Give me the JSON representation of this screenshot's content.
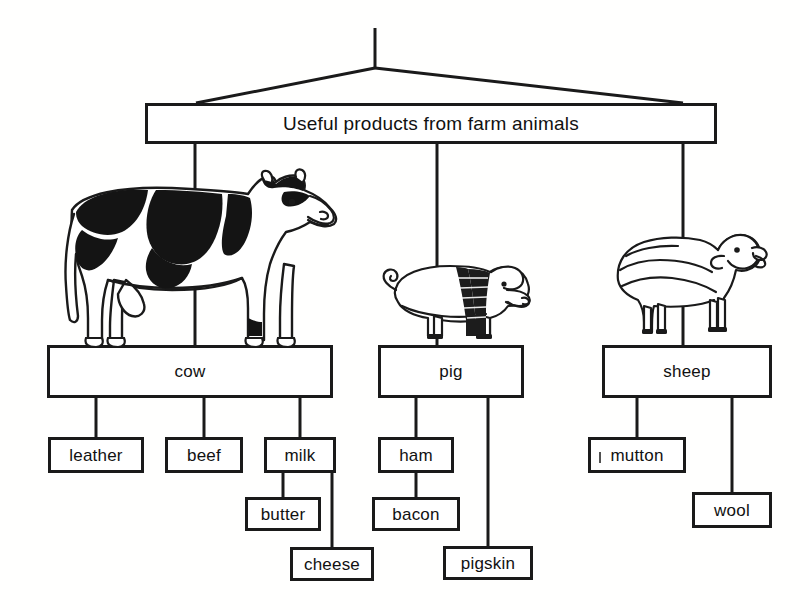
{
  "diagram": {
    "title": "Useful products from farm animals",
    "type": "hierarchy-tree",
    "root": {
      "id": "root",
      "label": "Useful products from farm animals",
      "x": 145,
      "y": 103,
      "w": 572,
      "h": 41
    },
    "hanger": {
      "name": "mobile-hanger",
      "apex_x": 375,
      "apex_y": 68,
      "top_y": 28,
      "left_x": 195,
      "right_x": 683,
      "bottom_y": 103
    },
    "animals": [
      {
        "id": "cow",
        "label": "cow",
        "x": 47,
        "y": 345,
        "w": 286,
        "h": 53,
        "illustration": "cow-illustration",
        "illustration_alt": "black and white holstein cow standing on box",
        "drop_from_root_x": 195
      },
      {
        "id": "pig",
        "label": "pig",
        "x": 378,
        "y": 345,
        "w": 146,
        "h": 53,
        "illustration": "pig-illustration",
        "illustration_alt": "white pig with black saddle band standing on box",
        "drop_from_root_x": 437
      },
      {
        "id": "sheep",
        "label": "sheep",
        "x": 602,
        "y": 345,
        "w": 170,
        "h": 53,
        "illustration": "sheep-illustration",
        "illustration_alt": "woolly sheep standing on box",
        "drop_from_root_x": 683
      }
    ],
    "products": [
      {
        "id": "leather",
        "label": "leather",
        "parent": "cow",
        "x": 48,
        "y": 437,
        "w": 96,
        "h": 36,
        "artifact": false
      },
      {
        "id": "beef",
        "label": "beef",
        "parent": "cow",
        "x": 165,
        "y": 437,
        "w": 78,
        "h": 36,
        "artifact": false
      },
      {
        "id": "milk",
        "label": "milk",
        "parent": "cow",
        "x": 264,
        "y": 437,
        "w": 72,
        "h": 36,
        "artifact": false
      },
      {
        "id": "butter",
        "label": "butter",
        "parent": "milk",
        "x": 245,
        "y": 497,
        "w": 76,
        "h": 34,
        "artifact": false
      },
      {
        "id": "cheese",
        "label": "cheese",
        "parent": "milk",
        "x": 290,
        "y": 547,
        "w": 84,
        "h": 34,
        "artifact": false
      },
      {
        "id": "ham",
        "label": "ham",
        "parent": "pig",
        "x": 378,
        "y": 437,
        "w": 76,
        "h": 36,
        "artifact": false
      },
      {
        "id": "bacon",
        "label": "bacon",
        "parent": "ham",
        "x": 372,
        "y": 497,
        "w": 88,
        "h": 34,
        "artifact": false
      },
      {
        "id": "pigskin",
        "label": "pigskin",
        "parent": "pig",
        "x": 443,
        "y": 546,
        "w": 90,
        "h": 34,
        "artifact": false
      },
      {
        "id": "mutton",
        "label": "mutton",
        "parent": "sheep",
        "x": 588,
        "y": 437,
        "w": 98,
        "h": 36,
        "artifact": true
      },
      {
        "id": "wool",
        "label": "wool",
        "parent": "sheep",
        "x": 692,
        "y": 492,
        "w": 80,
        "h": 36,
        "artifact": false
      }
    ],
    "colors": {
      "ink": "#1a1a1a",
      "background": "#ffffff",
      "cow_patch": "#141414",
      "pig_band": "#1c1c1c"
    }
  }
}
